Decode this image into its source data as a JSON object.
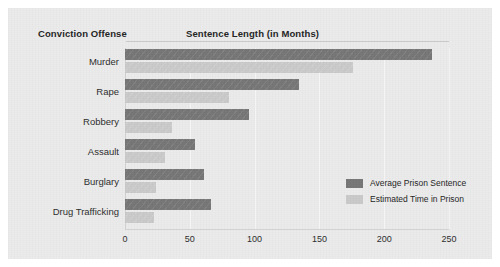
{
  "chart_data": {
    "type": "bar",
    "orientation": "horizontal",
    "title": "",
    "category_header": "Conviction Offense",
    "value_header": "Sentence Length (in Months)",
    "xlabel": "Sentence Length (in Months)",
    "ylabel": "Conviction Offense",
    "categories": [
      "Murder",
      "Rape",
      "Robbery",
      "Assault",
      "Burglary",
      "Drug Trafficking"
    ],
    "series": [
      {
        "name": "Average Prison Sentence",
        "color": "#757575",
        "values": [
          237,
          134,
          96,
          54,
          61,
          66
        ]
      },
      {
        "name": "Estimated Time in Prison",
        "color": "#c9c9c9",
        "values": [
          176,
          80,
          36,
          31,
          24,
          22
        ]
      }
    ],
    "xlim": [
      0,
      250
    ],
    "xticks": [
      0,
      50,
      100,
      150,
      200,
      250
    ],
    "xtick_labels": [
      "0",
      "50",
      "100",
      "150",
      "200",
      "250"
    ],
    "grid": true,
    "grid_axis": "x",
    "legend_position": "inside-right-lower"
  },
  "legend": {
    "entries": [
      {
        "label": "Average Prison Sentence",
        "swatch": "dark"
      },
      {
        "label": "Estimated Time in Prison",
        "swatch": "light"
      }
    ]
  },
  "colors": {
    "background": "#ebebeb",
    "page": "#ffffff",
    "dark_series": "#757575",
    "light_series": "#c9c9c9",
    "axis": "#d2d2d2",
    "gridline": "#f6f6f6",
    "text": "#232323"
  }
}
